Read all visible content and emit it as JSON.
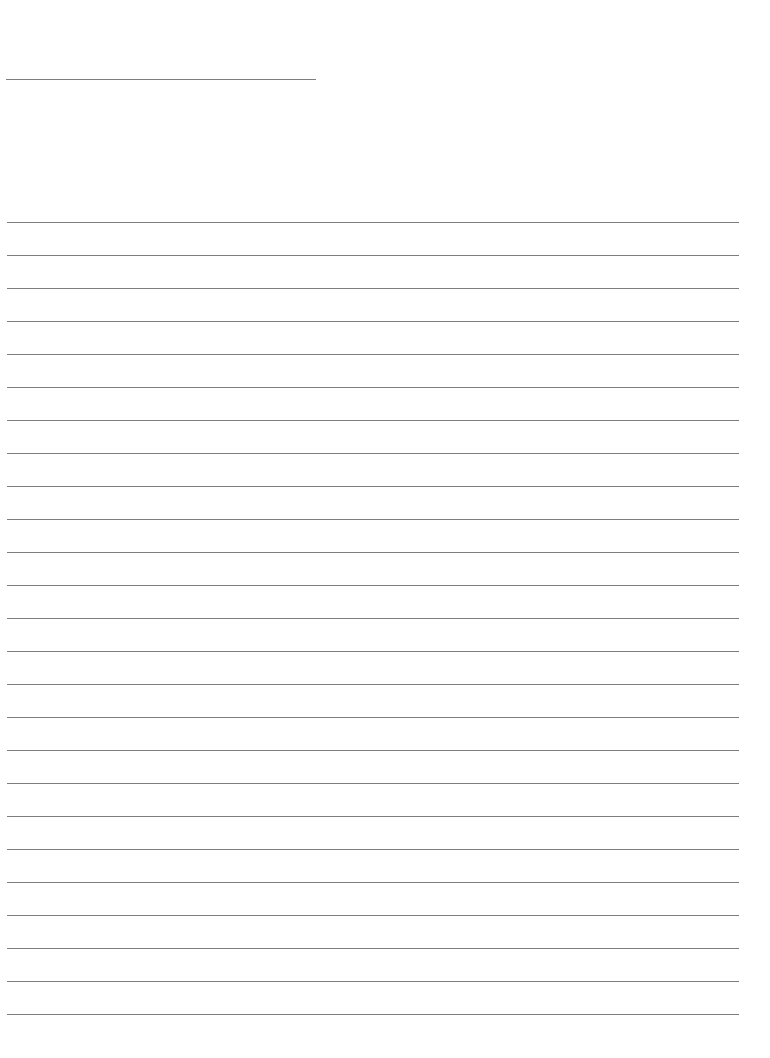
{
  "page": {
    "type": "blank lined paper",
    "header_line": {
      "y": 79,
      "x_start": 6,
      "x_end": 316
    },
    "ruled_lines": {
      "count": 25,
      "first_y": 222,
      "spacing": 33,
      "x_start": 7,
      "x_end": 739
    },
    "line_color": "#7e7e7e",
    "background_color": "#ffffff"
  }
}
